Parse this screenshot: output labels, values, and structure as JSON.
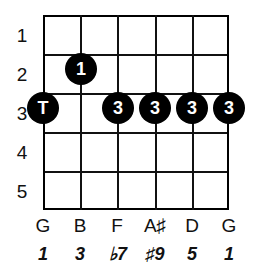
{
  "diagram": {
    "type": "guitar-fretboard-chord-diagram",
    "strings": 6,
    "frets": 5,
    "colors": {
      "background": "#ffffff",
      "grid": "#111111",
      "dot_fill": "#000000",
      "dot_text": "#ffffff",
      "text": "#111111"
    },
    "fret_numbers": [
      "1",
      "2",
      "3",
      "4",
      "5"
    ],
    "markers": [
      {
        "id": "marker-thumb",
        "label": "T",
        "string": 1,
        "fret": 3,
        "x": 43,
        "y": 108
      },
      {
        "id": "marker-index",
        "label": "1",
        "string": 2,
        "fret": 2,
        "x": 81,
        "y": 69
      },
      {
        "id": "marker-ring-f",
        "label": "3",
        "string": 3,
        "fret": 3,
        "x": 118,
        "y": 108
      },
      {
        "id": "marker-ring-as",
        "label": "3",
        "string": 4,
        "fret": 3,
        "x": 155,
        "y": 108
      },
      {
        "id": "marker-ring-d",
        "label": "3",
        "string": 5,
        "fret": 3,
        "x": 192,
        "y": 108
      },
      {
        "id": "marker-ring-g",
        "label": "3",
        "string": 6,
        "fret": 3,
        "x": 229,
        "y": 108
      }
    ],
    "string_positions": [
      43,
      80.2,
      117.4,
      154.6,
      191.8,
      229
    ],
    "fret_positions": [
      15,
      54,
      93,
      132,
      171,
      210
    ],
    "note_names": [
      "G",
      "B",
      "F",
      "A♯",
      "D",
      "G"
    ],
    "intervals": [
      "1",
      "3",
      "♭7",
      "♯9",
      "5",
      "1"
    ]
  }
}
